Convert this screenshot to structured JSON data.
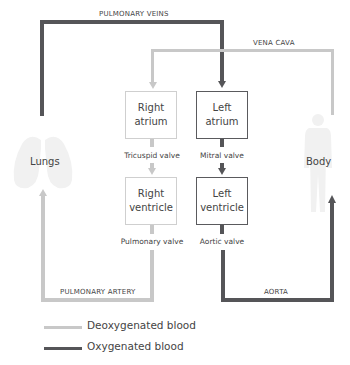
{
  "diagram": {
    "type": "flowchart",
    "title": "",
    "colors": {
      "deoxygenated": "#c8c8c8",
      "oxygenated": "#555558"
    },
    "vessels": {
      "pulmonary_veins": "PULMONARY VEINS",
      "vena_cava": "VENA CAVA",
      "pulmonary_artery": "PULMONARY ARTERY",
      "aorta": "AORTA"
    },
    "chambers": {
      "right_atrium": {
        "line1": "Right",
        "line2": "atrium"
      },
      "left_atrium": {
        "line1": "Left",
        "line2": "atrium"
      },
      "right_ventricle": {
        "line1": "Right",
        "line2": "ventricle"
      },
      "left_ventricle": {
        "line1": "Left",
        "line2": "ventricle"
      }
    },
    "valves": {
      "tricuspid": "Tricuspid valve",
      "mitral": "Mitral valve",
      "pulmonary": "Pulmonary valve",
      "aortic": "Aortic valve"
    },
    "organs": {
      "lungs": "Lungs",
      "body": "Body"
    },
    "legend": [
      {
        "label": "Deoxygenated blood",
        "color": "#c8c8c8"
      },
      {
        "label": "Oxygenated blood",
        "color": "#555558"
      }
    ],
    "edges": [
      {
        "from": "Lungs",
        "to": "Left atrium",
        "via": "PULMONARY VEINS",
        "blood": "oxygenated"
      },
      {
        "from": "Body",
        "to": "Right atrium",
        "via": "VENA CAVA",
        "blood": "deoxygenated"
      },
      {
        "from": "Right atrium",
        "to": "Right ventricle",
        "via": "Tricuspid valve",
        "blood": "deoxygenated"
      },
      {
        "from": "Left atrium",
        "to": "Left ventricle",
        "via": "Mitral valve",
        "blood": "oxygenated"
      },
      {
        "from": "Right ventricle",
        "to": "Lungs",
        "via": "Pulmonary valve / PULMONARY ARTERY",
        "blood": "deoxygenated"
      },
      {
        "from": "Left ventricle",
        "to": "Body",
        "via": "Aortic valve / AORTA",
        "blood": "oxygenated"
      }
    ]
  }
}
